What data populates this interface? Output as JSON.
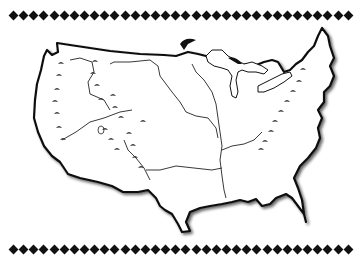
{
  "figure": {
    "style": "black-and-white line illustration with mountain symbols and major rivers",
    "border_ornament": "row of black diamonds",
    "top_border_diamond_count": 34,
    "bottom_border_diamond_count": 34,
    "features": [
      "coastline outline",
      "Great Lakes",
      "Mississippi River",
      "Missouri River",
      "Ohio River",
      "Rio Grande",
      "Rocky Mountains symbols",
      "Appalachian Mountains symbols",
      "Sierra Nevada / Cascade symbols"
    ]
  },
  "colors": {
    "background": "#ffffff",
    "ink": "#111111",
    "shadow": "#9a9a9a"
  }
}
